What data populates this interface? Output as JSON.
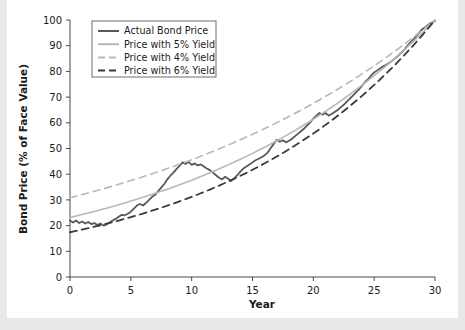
{
  "chart_data": {
    "type": "line",
    "title": "",
    "xlabel": "Year",
    "ylabel": "Bond Price (% of Face Value)",
    "xlim": [
      0,
      30
    ],
    "ylim": [
      0,
      100
    ],
    "xticks": [
      0,
      5,
      10,
      15,
      20,
      25,
      30
    ],
    "yticks": [
      0,
      10,
      20,
      30,
      40,
      50,
      60,
      70,
      80,
      90,
      100
    ],
    "grid": false,
    "legend_position": "upper left",
    "series": [
      {
        "name": "Actual Bond Price",
        "style": "solid",
        "color": "#595959",
        "width": 1.8,
        "x": [
          0,
          0.25,
          0.5,
          0.75,
          1,
          1.25,
          1.5,
          1.75,
          2,
          2.25,
          2.5,
          2.75,
          3,
          3.25,
          3.5,
          3.75,
          4,
          4.25,
          4.5,
          4.75,
          5,
          5.25,
          5.5,
          5.75,
          6,
          6.25,
          6.5,
          6.75,
          7,
          7.25,
          7.5,
          7.75,
          8,
          8.25,
          8.5,
          8.75,
          9,
          9.25,
          9.5,
          9.75,
          10,
          10.25,
          10.5,
          10.75,
          11,
          11.25,
          11.5,
          11.75,
          12,
          12.25,
          12.5,
          12.75,
          13,
          13.25,
          13.5,
          13.75,
          14,
          14.25,
          14.5,
          14.75,
          15,
          15.25,
          15.5,
          15.75,
          16,
          16.25,
          16.5,
          16.75,
          17,
          17.25,
          17.5,
          17.75,
          18,
          18.25,
          18.5,
          18.75,
          19,
          19.25,
          19.5,
          19.75,
          20,
          20.25,
          20.5,
          20.75,
          21,
          21.25,
          21.5,
          21.75,
          22,
          22.25,
          22.5,
          22.75,
          23,
          23.25,
          23.5,
          23.75,
          24,
          24.25,
          24.5,
          24.75,
          25,
          25.25,
          25.5,
          25.75,
          26,
          26.25,
          26.5,
          26.75,
          27,
          27.25,
          27.5,
          27.75,
          28,
          28.25,
          28.5,
          28.75,
          29,
          29.25,
          29.5,
          29.75,
          30
        ],
        "y": [
          22.0,
          21.2,
          22.0,
          21.0,
          21.6,
          20.8,
          21.4,
          20.6,
          21.0,
          20.2,
          20.8,
          20.0,
          20.4,
          21.2,
          22.0,
          22.6,
          23.4,
          24.2,
          24.0,
          24.6,
          25.4,
          26.6,
          27.8,
          28.4,
          27.8,
          28.8,
          30.0,
          31.2,
          32.0,
          33.4,
          34.8,
          36.2,
          38.0,
          39.4,
          40.6,
          42.0,
          43.2,
          44.6,
          44.0,
          44.8,
          43.6,
          44.2,
          43.4,
          43.8,
          43.0,
          42.2,
          41.6,
          40.6,
          39.6,
          38.6,
          38.0,
          39.0,
          38.2,
          37.4,
          38.4,
          39.6,
          41.0,
          42.2,
          43.0,
          43.8,
          44.6,
          45.4,
          46.0,
          46.6,
          47.4,
          48.4,
          50.2,
          51.8,
          53.4,
          52.6,
          53.2,
          52.4,
          53.0,
          53.8,
          54.8,
          55.8,
          56.8,
          57.8,
          59.0,
          60.2,
          61.6,
          62.8,
          63.8,
          63.2,
          63.8,
          62.8,
          63.4,
          64.2,
          65.0,
          66.0,
          67.0,
          68.2,
          69.4,
          70.6,
          71.8,
          73.0,
          74.4,
          75.8,
          77.0,
          78.4,
          79.6,
          80.4,
          81.2,
          82.0,
          82.6,
          83.4,
          84.2,
          85.2,
          86.2,
          87.4,
          88.6,
          90.0,
          91.4,
          92.6,
          94.0,
          95.4,
          96.6,
          97.4,
          98.4,
          99.0,
          99.6
        ]
      },
      {
        "name": "Price with 5% Yield",
        "style": "solid",
        "color": "#b8b8b8",
        "width": 1.6,
        "yield": 5,
        "anchor_points": [
          [
            0,
            23.1
          ],
          [
            5,
            29.5
          ],
          [
            10,
            37.7
          ],
          [
            15,
            48.1
          ],
          [
            20,
            61.4
          ],
          [
            25,
            78.4
          ],
          [
            30,
            100
          ]
        ]
      },
      {
        "name": "Price with 4% Yield",
        "style": "dashed",
        "color": "#b8b8b8",
        "width": 1.6,
        "yield": 4,
        "anchor_points": [
          [
            0,
            30.8
          ],
          [
            5,
            37.5
          ],
          [
            10,
            45.6
          ],
          [
            15,
            55.5
          ],
          [
            20,
            67.6
          ],
          [
            25,
            82.2
          ],
          [
            30,
            100
          ]
        ]
      },
      {
        "name": "Price with 6% Yield",
        "style": "dashed",
        "color": "#3a3a3a",
        "width": 1.8,
        "yield": 6,
        "anchor_points": [
          [
            0,
            17.4
          ],
          [
            5,
            23.3
          ],
          [
            10,
            31.2
          ],
          [
            15,
            41.7
          ],
          [
            20,
            55.8
          ],
          [
            25,
            74.7
          ],
          [
            30,
            100
          ]
        ]
      }
    ],
    "legend_entries": [
      {
        "label": "Actual Bond Price",
        "style": "solid",
        "color": "#595959"
      },
      {
        "label": "Price with 5% Yield",
        "style": "solid",
        "color": "#b8b8b8"
      },
      {
        "label": "Price with 4% Yield",
        "style": "dashed",
        "color": "#b8b8b8"
      },
      {
        "label": "Price with 6% Yield",
        "style": "dashed",
        "color": "#3a3a3a"
      }
    ]
  }
}
